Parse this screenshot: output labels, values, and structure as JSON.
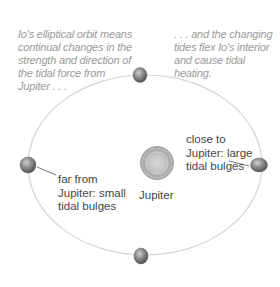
{
  "captions": {
    "left": "Io's elliptical orbit means continual changes in the strength and direction of the tidal force from Jupiter . . .",
    "right": ". . . and the changing tides flex Io's interior and cause tidal heating."
  },
  "labels": {
    "far": "far from Jupiter: small tidal bulges",
    "close": "close to Jupiter: large tidal bulges",
    "jupiter": "Jupiter"
  },
  "orbit": {
    "shape": "ellipse",
    "stroke_color": "#d4d4d4"
  },
  "bodies": [
    {
      "name": "Jupiter",
      "color": "#b8b8b8"
    },
    {
      "name": "Io (top of orbit)",
      "color": "#8a8a8a"
    },
    {
      "name": "Io (far from Jupiter, left)",
      "color": "#8a8a8a"
    },
    {
      "name": "Io (close to Jupiter, right, elongated by large tidal bulges)",
      "color": "#8a8a8a"
    },
    {
      "name": "Io (bottom of orbit)",
      "color": "#8a8a8a"
    }
  ],
  "colors": {
    "caption_text": "#9a9a9a",
    "label_text": "#444444",
    "leader_line": "#555555",
    "background": "#ffffff"
  }
}
